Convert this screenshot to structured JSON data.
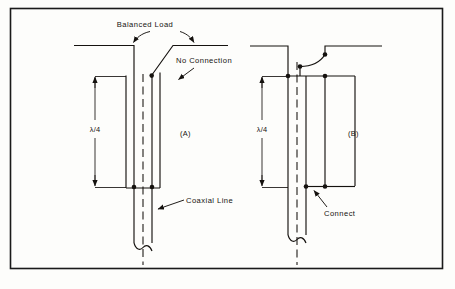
{
  "figure": {
    "background_color": "#fdfdfb",
    "ink_color": "#15120f",
    "border": {
      "name": "figure-border",
      "color": "#1a1a1a"
    }
  },
  "labels": {
    "balanced_load": "Balanced Load",
    "no_connection": "No Connection",
    "coaxial_line": "Coaxial Line",
    "connect": "Connect",
    "quarter_wave_left": "λ/4",
    "quarter_wave_right": "λ/4",
    "panel_a": "(A)",
    "panel_b": "(B)"
  },
  "panels": [
    {
      "id": "A",
      "caption": "(A)",
      "dimension": "λ/4",
      "annotations": [
        "Balanced Load",
        "No Connection",
        "Coaxial Line"
      ],
      "junction_dots": 3,
      "description": "Quarter-wave sleeve open at top, shorted at bottom; outer conductor not connected at the upper end"
    },
    {
      "id": "B",
      "caption": "(B)",
      "dimension": "λ/4",
      "annotations": [
        "Connect"
      ],
      "junction_dots": 5,
      "description": "Quarter-wave section connected at the top via curved jumper and shorted at the bottom"
    }
  ],
  "icons": {
    "arrow": "arrowhead-icon",
    "dot": "junction-dot-icon",
    "break": "conductor-break-icon"
  }
}
